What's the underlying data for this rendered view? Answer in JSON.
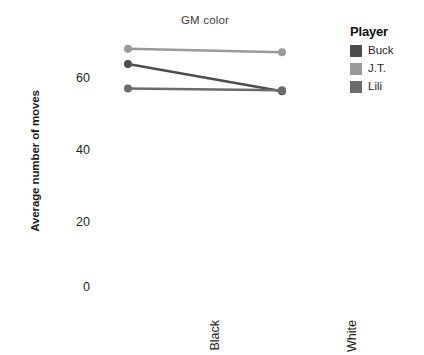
{
  "chart_data": {
    "type": "line",
    "title": "GM color",
    "xlabel": "",
    "ylabel": "Average number of moves",
    "categories": [
      "Black",
      "White"
    ],
    "x": [
      0,
      1
    ],
    "ylim": [
      0,
      72
    ],
    "yticks": [
      0,
      20,
      40,
      60
    ],
    "ytick_labels": [
      "0",
      "20",
      "40",
      "60"
    ],
    "grid": false,
    "legend": {
      "title": "Player",
      "position": "right",
      "entries": [
        {
          "name": "Buck",
          "color": "#4d4d4d"
        },
        {
          "name": "J.T.",
          "color": "#9a9a9a"
        },
        {
          "name": "Lili",
          "color": "#6b6b6b"
        }
      ]
    },
    "series": [
      {
        "name": "Buck",
        "color": "#4d4d4d",
        "values": [
          64.0,
          56.2
        ]
      },
      {
        "name": "J.T.",
        "color": "#9a9a9a",
        "values": [
          68.4,
          67.4
        ]
      },
      {
        "name": "Lili",
        "color": "#6b6b6b",
        "values": [
          57.0,
          56.5
        ]
      }
    ],
    "markers": "circle",
    "marker_size": 4
  },
  "axes": {
    "y_title": "Average number of moves",
    "y_tick_0": "0",
    "y_tick_1": "20",
    "y_tick_2": "40",
    "y_tick_3": "60",
    "x_tick_0": "Black",
    "x_tick_1": "White"
  },
  "panel": {
    "title": "GM color"
  },
  "legend": {
    "title": "Player",
    "item_0": "Buck",
    "item_1": "J.T.",
    "item_2": "Lili"
  },
  "colors": {
    "buck": "#4d4d4d",
    "jt": "#9a9a9a",
    "lili": "#6b6b6b",
    "text": "#231f20",
    "background": "#ffffff"
  }
}
